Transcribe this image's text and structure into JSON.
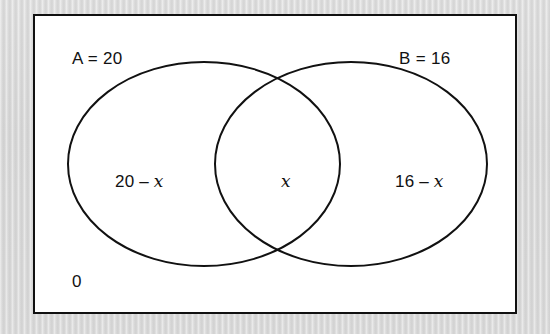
{
  "diagram": {
    "type": "venn-two-set",
    "universal_set_label": "0",
    "sets": [
      {
        "id": "A",
        "label": "A = 20",
        "name": "A",
        "cardinality": 20
      },
      {
        "id": "B",
        "label": "B = 16",
        "name": "B",
        "cardinality": 16
      }
    ],
    "regions": [
      {
        "id": "only-a",
        "number": "20",
        "operator": "–",
        "variable": "x"
      },
      {
        "id": "intersection",
        "number": "",
        "operator": "",
        "variable": "x"
      },
      {
        "id": "only-b",
        "number": "16",
        "operator": "–",
        "variable": "x"
      }
    ],
    "colors": {
      "stroke": "#111111",
      "fill": "#ffffff",
      "page_background": "#dcdcdc"
    }
  }
}
